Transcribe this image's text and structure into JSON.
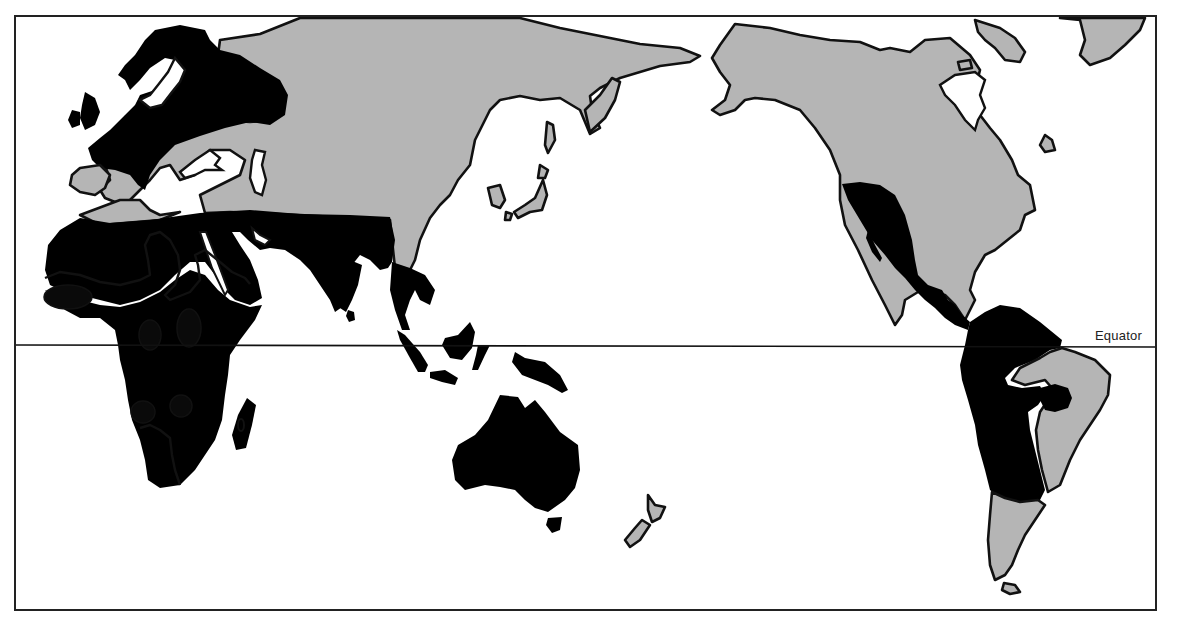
{
  "map": {
    "type": "world-thematic-map",
    "projection": "Pacific-centered",
    "labels": {
      "equator": "Equator"
    },
    "shading_levels": [
      {
        "name": "light",
        "color": "#b5b5b5"
      },
      {
        "name": "medium",
        "color": "#7e7e7e"
      },
      {
        "name": "dark",
        "color": "#0a0a0a"
      }
    ],
    "regions": [
      {
        "name": "Europe",
        "shade": "medium"
      },
      {
        "name": "Northern Asia",
        "shade": "light"
      },
      {
        "name": "North Africa / Middle East / South Asia",
        "shade": "medium"
      },
      {
        "name": "Sub-Saharan Africa",
        "shade": "medium"
      },
      {
        "name": "West Africa hotspot",
        "shade": "dark"
      },
      {
        "name": "Central Africa hotspots",
        "shade": "dark"
      },
      {
        "name": "Southern Africa hotspots",
        "shade": "dark"
      },
      {
        "name": "Southeast Asia / Indonesia",
        "shade": "medium"
      },
      {
        "name": "Australia",
        "shade": "medium"
      },
      {
        "name": "New Zealand",
        "shade": "light"
      },
      {
        "name": "North America",
        "shade": "light"
      },
      {
        "name": "Mexico / Central America",
        "shade": "medium"
      },
      {
        "name": "South America (north & west)",
        "shade": "medium"
      },
      {
        "name": "Eastern Brazil",
        "shade": "light"
      },
      {
        "name": "Southern South America",
        "shade": "light"
      },
      {
        "name": "Greenland",
        "shade": "light"
      }
    ]
  }
}
